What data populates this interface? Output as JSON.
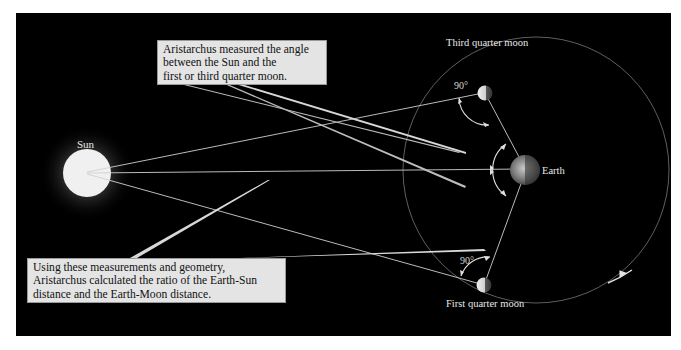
{
  "diagram": {
    "background_color": "#000000",
    "bodies": {
      "sun": {
        "label": "Sun",
        "color": "#f2f2f2"
      },
      "earth": {
        "label": "Earth"
      },
      "third_quarter_moon": {
        "label": "Third quarter moon"
      },
      "first_quarter_moon": {
        "label": "First quarter moon"
      }
    },
    "angles": {
      "top": "90°",
      "bottom": "90°"
    },
    "callouts": {
      "top": {
        "lines": [
          "Aristarchus measured the angle",
          "between the Sun and the",
          "first or third quarter moon."
        ]
      },
      "bottom": {
        "lines": [
          "Using these measurements and geometry,",
          "Aristarchus calculated the ratio of the Earth-Sun",
          "distance and the Earth-Moon distance."
        ]
      }
    }
  }
}
